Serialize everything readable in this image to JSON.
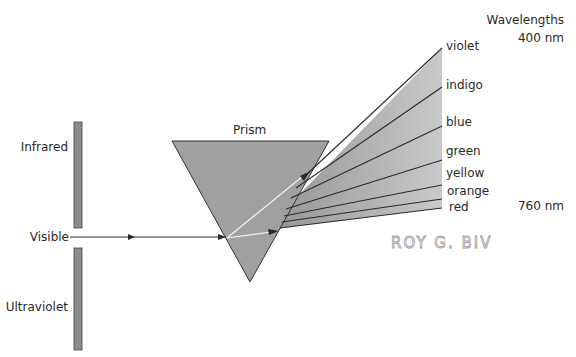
{
  "diagram": {
    "type": "prism dispersion",
    "title_prism": "Prism",
    "left_labels": {
      "infrared": "Infrared",
      "visible": "Visible",
      "ultraviolet": "Ultraviolet"
    },
    "wavelengths": {
      "header": "Wavelengths",
      "top": "400 nm",
      "bottom": "760 nm"
    },
    "spectrum": [
      {
        "name": "violet",
        "label": "violet",
        "y": 48
      },
      {
        "name": "indigo",
        "label": "indigo",
        "y": 87
      },
      {
        "name": "blue",
        "label": "blue",
        "y": 126
      },
      {
        "name": "green",
        "label": "green",
        "y": 160
      },
      {
        "name": "yellow",
        "label": "yellow",
        "y": 185
      },
      {
        "name": "orange",
        "label": "orange",
        "y": 199
      },
      {
        "name": "red",
        "label": "red",
        "y": 208
      }
    ],
    "annotation": "ROY G. BIV",
    "colors": {
      "prism_fill": "#9e9e9e",
      "fan_light": "#cfcfcf",
      "fan_dark": "#8f8f8f",
      "line": "#2a2a2a",
      "bar_fill": "#8c8c8c",
      "handwriting": "#9a9a9a"
    }
  }
}
